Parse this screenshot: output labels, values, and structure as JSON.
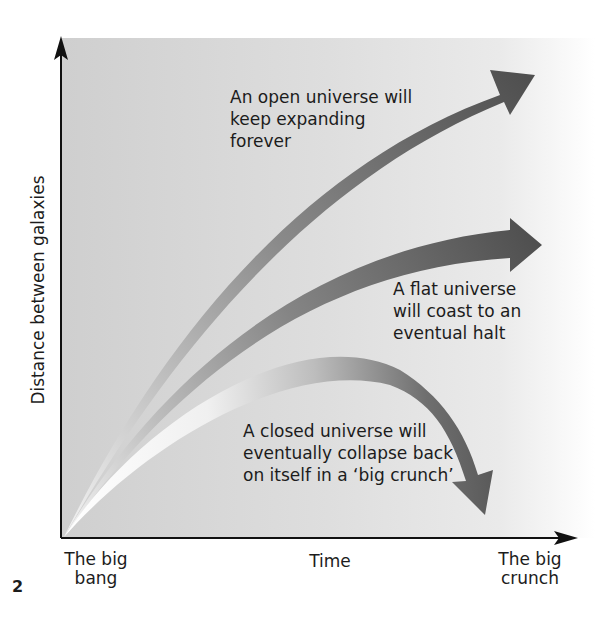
{
  "figure": {
    "number": "2",
    "y_axis_label": "Distance between galaxies",
    "x_axis_label": "Time",
    "x_start_label": [
      "The big",
      "bang"
    ],
    "x_end_label": [
      "The big",
      "crunch"
    ]
  },
  "curves": [
    {
      "name": "open",
      "annotation": [
        "An open universe will",
        "keep expanding",
        "forever"
      ],
      "behavior": "expands forever"
    },
    {
      "name": "flat",
      "annotation": [
        "A flat universe",
        "will coast to an",
        "eventual halt"
      ],
      "behavior": "coasts to halt"
    },
    {
      "name": "closed",
      "annotation": [
        "A closed universe will",
        "eventually collapse back",
        "on itself in a ‘big crunch’"
      ],
      "behavior": "collapses"
    }
  ],
  "colors": {
    "arrow_dark": "#555555",
    "arrow_light": "#f2f2f2",
    "axis": "#111111",
    "background_left": "#cfcfcf"
  }
}
